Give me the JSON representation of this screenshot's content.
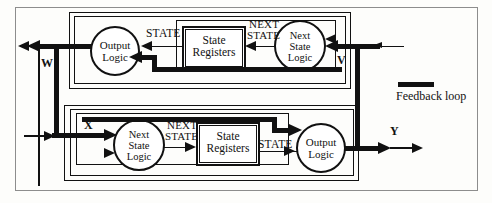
{
  "diagram": {
    "legend": {
      "swatch_name": "feedback-loop-swatch",
      "label": "Feedback loop",
      "color": "#111111"
    },
    "machines": [
      {
        "id": "upper-machine",
        "position": "top",
        "flow": "right-to-left",
        "blocks": [
          {
            "id": "upper-output-logic",
            "kind": "circle",
            "line1": "Output",
            "line2": "Logic",
            "line3": ""
          },
          {
            "id": "upper-state-registers",
            "kind": "box",
            "line1": "State",
            "line2": "Registers",
            "line3": ""
          },
          {
            "id": "upper-next-state-logic",
            "kind": "circle",
            "line1": "Next",
            "line2": "State",
            "line3": "Logic"
          }
        ],
        "signals": [
          {
            "id": "upper-state-label",
            "text": "STATE"
          },
          {
            "id": "upper-next-state-label",
            "text": "NEXT\nSTATE",
            "line1": "NEXT",
            "line2": "STATE"
          }
        ],
        "ports": [
          {
            "id": "port-w",
            "label": "W",
            "role": "output",
            "side": "left"
          },
          {
            "id": "port-v",
            "label": "V",
            "role": "input",
            "side": "right"
          }
        ]
      },
      {
        "id": "lower-machine",
        "position": "bottom",
        "flow": "left-to-right",
        "blocks": [
          {
            "id": "lower-next-state-logic",
            "kind": "circle",
            "line1": "Next",
            "line2": "State",
            "line3": "Logic"
          },
          {
            "id": "lower-state-registers",
            "kind": "box",
            "line1": "State",
            "line2": "Registers",
            "line3": ""
          },
          {
            "id": "lower-output-logic",
            "kind": "circle",
            "line1": "Output",
            "line2": "Logic",
            "line3": ""
          }
        ],
        "signals": [
          {
            "id": "lower-next-state-label",
            "text": "NEXT\nSTATE",
            "line1": "NEXT",
            "line2": "STATE"
          },
          {
            "id": "lower-state-label",
            "text": "STATE"
          }
        ],
        "ports": [
          {
            "id": "port-x",
            "label": "X",
            "role": "input",
            "side": "left"
          },
          {
            "id": "port-y",
            "label": "Y",
            "role": "output",
            "side": "right"
          }
        ]
      }
    ],
    "labels": {
      "state": "STATE",
      "next": "NEXT",
      "state2": "STATE",
      "w": "W",
      "v": "V",
      "x": "X",
      "y": "Y",
      "output": "Output",
      "logic": "Logic",
      "next_word": "Next",
      "state_word": "State",
      "logic_word": "Logic",
      "state_reg_1": "State",
      "state_reg_2": "Registers",
      "feedback_loop": "Feedback loop"
    }
  }
}
